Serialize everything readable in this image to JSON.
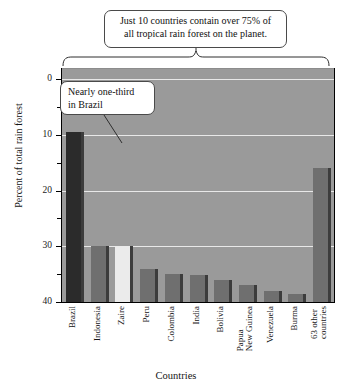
{
  "chart_data": {
    "type": "bar",
    "title": "",
    "xlabel": "Countries",
    "ylabel": "Percent of total rain forest",
    "ylim": [
      0,
      42
    ],
    "yticks_major": [
      0,
      10,
      20,
      30,
      40
    ],
    "yticks_minor": [
      5,
      15,
      25,
      35
    ],
    "grid": true,
    "legend": "none",
    "categories": [
      "Brazil",
      "Indonesia",
      "Zaire",
      "Peru",
      "Colombia",
      "India",
      "Bolivia",
      "Papua New Guinea",
      "Venezuela",
      "Burma",
      "63 other countries"
    ],
    "values": [
      30.5,
      10,
      10,
      6,
      5,
      4.8,
      4,
      3,
      2,
      1.5,
      24
    ],
    "annotations": [
      {
        "name": "top-callout",
        "text": "Just 10 countries contain over 75% of all tropical rain forest on the planet.",
        "line1": "Just 10 countries contain over 75% of",
        "line2": "all tropical rain forest on the planet."
      },
      {
        "name": "brazil-callout",
        "text": "Nearly one-third in Brazil",
        "line1": "Nearly one-third",
        "line2": "in Brazil"
      }
    ]
  },
  "axes": {
    "y_title": "Percent of total rain forest",
    "x_title": "Countries",
    "y_tick_labels": [
      "40",
      "30",
      "20",
      "10",
      "0"
    ]
  },
  "labels": {
    "brazil": "Brazil",
    "indonesia": "Indonesia",
    "zaire": "Zaire",
    "peru": "Peru",
    "colombia": "Colombia",
    "india": "India",
    "bolivia": "Bolivia",
    "papua_l1": "Papua",
    "papua_l2": "New Guinea",
    "venezuela": "Venezuela",
    "burma": "Burma",
    "other_l1": "63 other",
    "other_l2": "countries"
  },
  "callouts": {
    "top_line1": "Just 10 countries contain over 75% of",
    "top_line2": "all tropical rain forest on the planet.",
    "brazil_line1": "Nearly one-third",
    "brazil_line2": "in Brazil"
  },
  "colors": {
    "plot_background": "#9a9a9a",
    "gridline": "#e8e8e8",
    "bar_default": "#6f6f6f",
    "bar_side": "#3c3c3c",
    "bar_brazil": "#2b2b2b",
    "bar_zaire": "#ebebeb",
    "axis": "#000000",
    "callout_border": "#4a4a4a",
    "text": "#151515"
  }
}
